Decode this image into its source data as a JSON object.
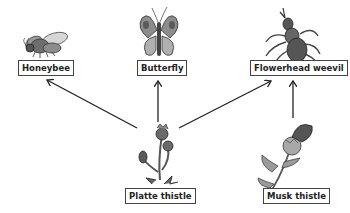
{
  "diagram": {
    "type": "food-web",
    "nodes": [
      {
        "id": "honeybee",
        "label": "Honeybee",
        "kind": "animal",
        "icon": "honeybee-icon"
      },
      {
        "id": "butterfly",
        "label": "Butterfly",
        "kind": "animal",
        "icon": "butterfly-icon"
      },
      {
        "id": "weevil",
        "label": "Flowerhead weevil",
        "kind": "animal",
        "icon": "weevil-icon"
      },
      {
        "id": "platte",
        "label": "Platte thistle",
        "kind": "plant",
        "icon": "platte-thistle-icon"
      },
      {
        "id": "musk",
        "label": "Musk thistle",
        "kind": "plant",
        "icon": "musk-thistle-icon"
      }
    ],
    "edges": [
      {
        "from": "platte",
        "to": "honeybee"
      },
      {
        "from": "platte",
        "to": "butterfly"
      },
      {
        "from": "platte",
        "to": "weevil"
      },
      {
        "from": "musk",
        "to": "weevil"
      }
    ],
    "colors": {
      "arrow": "#222222",
      "label_border": "#444444",
      "illustration_dark": "#555555",
      "illustration_mid": "#8a8a8a",
      "illustration_light": "#bdbdbd"
    }
  }
}
